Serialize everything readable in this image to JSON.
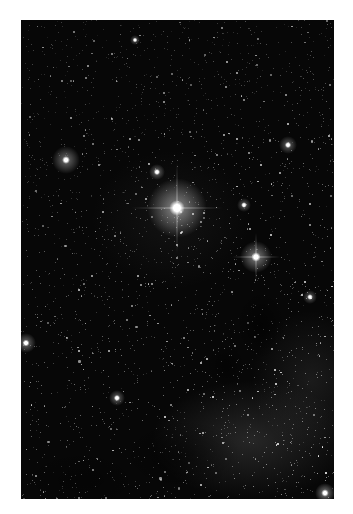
{
  "image": {
    "description": "Dense Milky Way starfield with one very bright central star, several bright stars, dark dust lanes and faint nebular glow in the lower half",
    "frame": {
      "left": 21,
      "top": 20,
      "width": 313,
      "height": 479
    },
    "background_color": "#070707",
    "page_background": "#ffffff"
  },
  "bright_stars": [
    {
      "x": 156,
      "y": 188,
      "r": 30,
      "core": 5,
      "spikes": true,
      "glow": 0.95
    },
    {
      "x": 235,
      "y": 237,
      "r": 16,
      "core": 3,
      "spikes": true,
      "glow": 0.85
    },
    {
      "x": 45,
      "y": 140,
      "r": 14,
      "core": 2.5,
      "spikes": false,
      "glow": 0.75
    },
    {
      "x": 136,
      "y": 152,
      "r": 8,
      "core": 2,
      "spikes": false,
      "glow": 0.6
    },
    {
      "x": 267,
      "y": 125,
      "r": 9,
      "core": 2,
      "spikes": false,
      "glow": 0.6
    },
    {
      "x": 223,
      "y": 185,
      "r": 7,
      "core": 1.8,
      "spikes": false,
      "glow": 0.55
    },
    {
      "x": 5,
      "y": 323,
      "r": 10,
      "core": 2.2,
      "spikes": false,
      "glow": 0.7
    },
    {
      "x": 96,
      "y": 378,
      "r": 8,
      "core": 2,
      "spikes": false,
      "glow": 0.6
    },
    {
      "x": 304,
      "y": 473,
      "r": 10,
      "core": 2.4,
      "spikes": false,
      "glow": 0.75
    },
    {
      "x": 289,
      "y": 277,
      "r": 7,
      "core": 1.8,
      "spikes": false,
      "glow": 0.55
    },
    {
      "x": 114,
      "y": 20,
      "r": 5,
      "core": 1.5,
      "spikes": false,
      "glow": 0.5
    }
  ],
  "hazes": [
    {
      "x": 230,
      "y": 420,
      "w": 200,
      "h": 120,
      "color": "rgba(150,150,150,0.22)"
    },
    {
      "x": 290,
      "y": 360,
      "w": 120,
      "h": 140,
      "color": "rgba(140,140,140,0.15)"
    },
    {
      "x": 150,
      "y": 200,
      "w": 160,
      "h": 140,
      "color": "rgba(120,120,120,0.10)"
    }
  ],
  "dark_lanes": [
    {
      "x": 240,
      "y": 305,
      "w": 50,
      "h": 70,
      "color": "rgba(0,0,0,0.55)"
    },
    {
      "x": 205,
      "y": 345,
      "w": 40,
      "h": 45,
      "color": "rgba(0,0,0,0.5)"
    },
    {
      "x": 160,
      "y": 435,
      "w": 120,
      "h": 70,
      "color": "rgba(0,0,0,0.45)"
    },
    {
      "x": 60,
      "y": 460,
      "w": 120,
      "h": 60,
      "color": "rgba(0,0,0,0.35)"
    }
  ],
  "field": {
    "count": 2600,
    "seed": 7
  }
}
